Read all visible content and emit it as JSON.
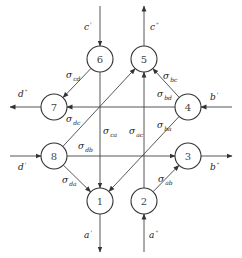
{
  "diagram": {
    "nodes": [
      {
        "id": "1",
        "label": "1"
      },
      {
        "id": "2",
        "label": "2"
      },
      {
        "id": "3",
        "label": "3"
      },
      {
        "id": "4",
        "label": "4"
      },
      {
        "id": "5",
        "label": "5"
      },
      {
        "id": "6",
        "label": "6"
      },
      {
        "id": "7",
        "label": "7"
      },
      {
        "id": "8",
        "label": "8"
      }
    ],
    "external_flows": [
      {
        "id": "c-in",
        "label": "c",
        "prime": "'",
        "direction": "in",
        "node": "6"
      },
      {
        "id": "c-out",
        "label": "c",
        "prime": "\"",
        "direction": "out",
        "node": "5"
      },
      {
        "id": "b-in",
        "label": "b",
        "prime": "'",
        "direction": "in",
        "node": "4"
      },
      {
        "id": "b-out",
        "label": "b",
        "prime": "\"",
        "direction": "out",
        "node": "3"
      },
      {
        "id": "a-in",
        "label": "a",
        "prime": "\"",
        "direction": "in",
        "node": "2"
      },
      {
        "id": "a-out",
        "label": "a",
        "prime": "'",
        "direction": "out",
        "node": "1"
      },
      {
        "id": "d-in",
        "label": "d",
        "prime": "'",
        "direction": "in",
        "node": "8"
      },
      {
        "id": "d-out",
        "label": "d",
        "prime": "\"",
        "direction": "out",
        "node": "7"
      }
    ],
    "edges": [
      {
        "id": "cd",
        "from": "6",
        "to": "7",
        "symbol": "σ",
        "sub": "cd"
      },
      {
        "id": "ca",
        "from": "6",
        "to": "1",
        "symbol": "σ",
        "sub": "ca"
      },
      {
        "id": "ac",
        "from": "2",
        "to": "5",
        "symbol": "σ",
        "sub": "ac"
      },
      {
        "id": "ab",
        "from": "2",
        "to": "3",
        "symbol": "σ",
        "sub": "ab"
      },
      {
        "id": "bc",
        "from": "4",
        "to": "5",
        "symbol": "σ",
        "sub": "bc"
      },
      {
        "id": "bd",
        "from": "4",
        "to": "7",
        "symbol": "σ",
        "sub": "bd"
      },
      {
        "id": "ba",
        "from": "4",
        "to": "1",
        "symbol": "σ",
        "sub": "ba"
      },
      {
        "id": "dc",
        "from": "8",
        "to": "5",
        "symbol": "σ",
        "sub": "dc"
      },
      {
        "id": "db",
        "from": "8",
        "to": "3",
        "symbol": "σ",
        "sub": "db"
      },
      {
        "id": "da",
        "from": "8",
        "to": "1",
        "symbol": "σ",
        "sub": "da"
      }
    ]
  }
}
